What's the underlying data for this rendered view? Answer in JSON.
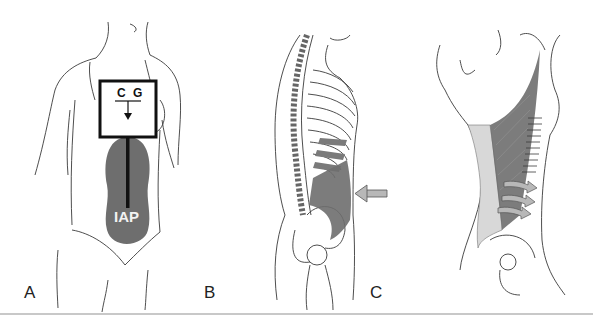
{
  "figure": {
    "panels": [
      {
        "id": "A",
        "label": "A",
        "description": "Front view of female torso with center of gravity box and intra-abdominal pressure balloon"
      },
      {
        "id": "B",
        "label": "B",
        "description": "Lateral view of spine and rib cage with shaded transversus abdominis and inward arrow"
      },
      {
        "id": "C",
        "label": "C",
        "description": "Posterior-lateral view of thoracolumbar fascia with latissimus muscle and three arrows"
      }
    ],
    "annotations": {
      "cg": "C G",
      "iap": "IAP"
    },
    "colors": {
      "line": "#3a3a3a",
      "muscle_shade": "#6e6e6e",
      "fascia": "#d8d8d8",
      "arrow_fill": "#b8b8b8",
      "rule": "#c8c8c8"
    }
  }
}
